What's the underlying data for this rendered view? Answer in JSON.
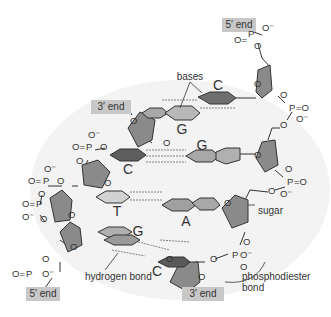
{
  "labels": {
    "five_prime_top": "5′ end",
    "three_prime_top": "3′ end",
    "five_prime_bottom": "5′ end",
    "three_prime_bottom": "3′ end",
    "bases": "bases",
    "sugar": "sugar",
    "hydrogen_bond": "hydrogen bond",
    "phosphodiester_line1": "phosphodiester",
    "phosphodiester_line2": "bond"
  },
  "base_letters": {
    "c_top": "C",
    "g_upper_left": "G",
    "g_upper_right": "G",
    "c_mid_left": "C",
    "t_mid": "T",
    "a_mid": "A",
    "g_lower": "G",
    "c_bottom": "C"
  },
  "atoms": {
    "O": "O",
    "P": "P",
    "O_minus": "O⁻",
    "O_eq": "O=",
    "eq_O": "=O"
  },
  "colors": {
    "sugar_fill": "#8a8a8a",
    "base_dark": "#6e6e6e",
    "base_mid": "#a8a8a8",
    "base_light": "#d2d2d2",
    "tag_fill": "#c8c8c8",
    "background_shade": "#f2f2f2",
    "line": "#333333"
  }
}
